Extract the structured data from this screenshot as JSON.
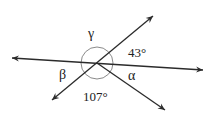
{
  "diagram": {
    "type": "intersecting-lines-angles",
    "center": [
      97,
      63
    ],
    "colors": {
      "line": "#2b2b2b",
      "arc": "#8a8a8a",
      "text": "#222222",
      "background": "#ffffff"
    },
    "lines": [
      {
        "name": "horizontal-line",
        "from": [
          12,
          58
        ],
        "to": [
          203,
          70
        ],
        "arrows": "both"
      },
      {
        "name": "diagonal-up-right-line",
        "from": [
          52,
          100
        ],
        "to": [
          153,
          16
        ],
        "arrows": "both"
      },
      {
        "name": "ray-down-right",
        "from": [
          97,
          63
        ],
        "to": [
          165,
          110
        ],
        "arrows": "end"
      }
    ],
    "arc": {
      "radius": 16
    },
    "labels": {
      "gamma": "γ",
      "angle_top_right": "43°",
      "beta": "β",
      "alpha": "α",
      "angle_bottom": "107°"
    }
  }
}
